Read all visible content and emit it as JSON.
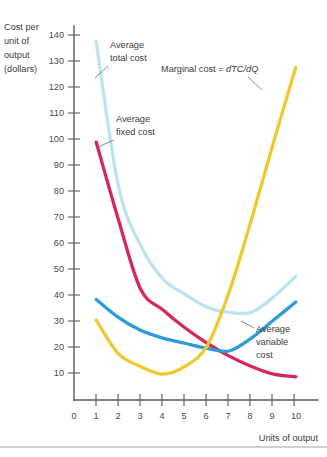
{
  "figure": {
    "y_axis_title_lines": [
      "Cost per",
      "unit of",
      "output",
      "(dollars)"
    ],
    "x_axis_title": "Units of output",
    "annotations": {
      "atc": [
        "Average",
        "total cost"
      ],
      "afc": [
        "Average",
        "fixed cost"
      ],
      "avc": [
        "Average",
        "variable",
        "cost"
      ],
      "mc_prefix": "Marginal cost = ",
      "mc_formula": "dTC/dQ"
    },
    "colors": {
      "average_total_cost": "#bde3f0",
      "average_fixed_cost": "#d6275a",
      "average_variable_cost": "#2e9bd4",
      "marginal_cost": "#efc82f",
      "axis": "#58595b",
      "text": "#3b3b3b",
      "rule": "#9a9a9a"
    }
  },
  "chart_data": {
    "type": "line",
    "title": "",
    "xlabel": "Units of output",
    "ylabel": "Cost per unit of output (dollars)",
    "xlim": [
      0,
      11
    ],
    "ylim": [
      0,
      145
    ],
    "xticks": [
      0,
      1,
      2,
      3,
      4,
      5,
      6,
      7,
      8,
      9,
      10
    ],
    "yticks": [
      10,
      20,
      30,
      40,
      50,
      60,
      70,
      80,
      90,
      100,
      110,
      120,
      130,
      140
    ],
    "grid": false,
    "legend": "inline-annotations",
    "x": [
      1,
      2,
      3,
      4,
      5,
      6,
      7,
      8,
      9,
      10
    ],
    "series": [
      {
        "name": "Average total cost",
        "color": "#bde3f0",
        "values": [
          139,
          83,
          60,
          47,
          41,
          36,
          34,
          34,
          40,
          48
        ]
      },
      {
        "name": "Average fixed cost",
        "color": "#d6275a",
        "values": [
          100,
          70,
          43,
          35,
          28,
          22,
          17,
          13,
          10,
          9
        ]
      },
      {
        "name": "Average variable cost",
        "color": "#2e9bd4",
        "values": [
          39,
          32,
          27,
          24,
          22,
          20,
          19,
          24,
          31,
          38
        ]
      },
      {
        "name": "Marginal cost = dTC/dQ",
        "color": "#efc82f",
        "values": [
          31,
          18,
          13,
          10,
          13,
          21,
          42,
          70,
          100,
          129
        ]
      }
    ]
  }
}
